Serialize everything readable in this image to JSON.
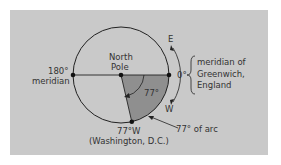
{
  "figure": {
    "panel_color": "#c9c9c9",
    "wedge_color": "#8f8f8f",
    "line_color": "#222222",
    "labels": {
      "north_pole_line1": "North",
      "north_pole_line2": "Pole",
      "meridian_180_line1": "180°",
      "meridian_180_line2": "meridian",
      "zero_degree": "0°",
      "greenwich_line1": "meridian of",
      "greenwich_line2": "Greenwich,",
      "greenwich_line3": "England",
      "east": "E",
      "west": "W",
      "angle": "77°",
      "washington_line1": "77°W",
      "washington_line2": "(Washington, D.C.)",
      "arc_label": "77° of arc"
    }
  }
}
